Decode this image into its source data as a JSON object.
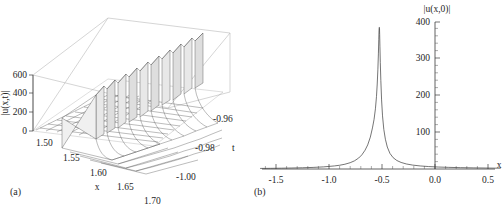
{
  "figure": {
    "background": "#ffffff",
    "line_color": "#3a3a3a",
    "panels": [
      {
        "id": "a",
        "label": "(a)",
        "type": "surface3d",
        "zlabel": "|u(x,t)|",
        "xlabel": "x",
        "ylabel": "t"
      },
      {
        "id": "b",
        "label": "(b)",
        "type": "line",
        "ylabel": "|u(x,0)|",
        "xlabel": "x"
      }
    ]
  },
  "chart_data": [
    {
      "type": "surface",
      "panel": "a",
      "title": "",
      "xlabel": "x",
      "ylabel": "t",
      "zlabel": "|u(x,t)|",
      "xlim": [
        1.5,
        1.7
      ],
      "ylim": [
        -1.0,
        -0.96
      ],
      "zlim": [
        0,
        600
      ],
      "xticks": [
        1.5,
        1.55,
        1.6,
        1.65,
        1.7
      ],
      "xticklabels": [
        "1.50",
        "1.55",
        "1.60",
        "1.65",
        "1.70"
      ],
      "yticks": [
        -0.96,
        -0.98,
        -1.0
      ],
      "yticklabels": [
        "-0.96",
        "-0.98",
        "-1.00"
      ],
      "zticks": [
        0,
        200,
        400,
        600
      ],
      "zticklabels": [
        "0",
        "200",
        "400",
        "600"
      ],
      "grid": true,
      "legend": "none",
      "description": "Blow-up solution modulus forming a steep wall of spikes rising along a curved crest; surface is flat and near zero on the near side and reaches ~600 at the ridge.",
      "ridge_peak_z": 600,
      "surface_mesh_nx": 18,
      "surface_mesh_ny": 14
    },
    {
      "type": "line",
      "panel": "b",
      "title": "",
      "xlabel": "x",
      "ylabel": "|u(x,0)|",
      "xlim": [
        -1.65,
        0.62
      ],
      "ylim": [
        0,
        415
      ],
      "xticks": [
        -1.5,
        -1.0,
        -0.5,
        0.0,
        0.5
      ],
      "xticklabels": [
        "-1.5",
        "-1.0",
        "-0.5",
        "0.0",
        "0.5"
      ],
      "yticks": [
        100,
        200,
        300,
        400
      ],
      "yticklabels": [
        "100",
        "200",
        "300",
        "400"
      ],
      "minor_xticks": true,
      "minor_yticks": true,
      "grid": false,
      "legend": "none",
      "axis_position": {
        "yaxis_at_x": 0.0,
        "xaxis_at_y": 0
      },
      "peak": {
        "x": -0.525,
        "y": 400
      },
      "series": [
        {
          "name": "|u(x,0)|",
          "x": [
            -1.65,
            -1.55,
            -1.45,
            -1.35,
            -1.25,
            -1.15,
            -1.05,
            -0.95,
            -0.9,
            -0.85,
            -0.8,
            -0.76,
            -0.72,
            -0.69,
            -0.66,
            -0.635,
            -0.61,
            -0.59,
            -0.575,
            -0.562,
            -0.552,
            -0.545,
            -0.539,
            -0.534,
            -0.5305,
            -0.528,
            -0.5265,
            -0.526,
            -0.525,
            -0.524,
            -0.5235,
            -0.522,
            -0.5195,
            -0.516,
            -0.511,
            -0.504,
            -0.495,
            -0.483,
            -0.468,
            -0.45,
            -0.425,
            -0.395,
            -0.36,
            -0.32,
            -0.27,
            -0.21,
            -0.14,
            -0.06,
            0.03,
            0.13,
            0.24,
            0.36,
            0.48,
            0.62
          ],
          "y": [
            1.6,
            1.9,
            2.3,
            2.8,
            3.5,
            4.5,
            6.0,
            8.6,
            10.6,
            13.5,
            17.8,
            23.0,
            31.0,
            40.0,
            53.0,
            68.0,
            90.0,
            116.0,
            140.0,
            170.0,
            205.0,
            240.0,
            280.0,
            325.0,
            365.0,
            390.0,
            399.0,
            400.0,
            400.0,
            399.0,
            396.0,
            380.0,
            345.0,
            300.0,
            250.0,
            195.0,
            150.0,
            112.0,
            84.0,
            62.0,
            44.0,
            32.0,
            24.0,
            18.5,
            14.2,
            11.0,
            8.6,
            6.9,
            5.6,
            4.6,
            3.8,
            3.2,
            2.7,
            2.2
          ]
        }
      ]
    }
  ]
}
